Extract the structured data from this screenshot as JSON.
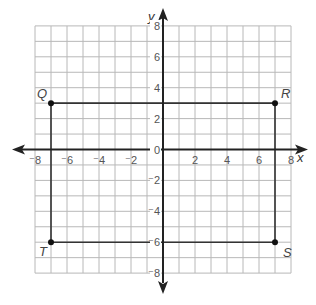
{
  "chart_data": {
    "type": "scatter",
    "title": "",
    "xlabel": "x",
    "ylabel": "y",
    "xlim": [
      -8,
      8
    ],
    "ylim": [
      -8,
      8
    ],
    "grid": true,
    "grid_step": 1,
    "x_ticks": [
      -8,
      -6,
      -4,
      -2,
      0,
      2,
      4,
      6,
      8
    ],
    "y_ticks": [
      -8,
      -6,
      -4,
      -2,
      0,
      2,
      4,
      6,
      8
    ],
    "x_tick_labels": [
      "⁻8",
      "⁻6",
      "⁻4",
      "⁻2",
      "",
      "2",
      "4",
      "6",
      "8"
    ],
    "y_tick_labels": [
      "⁻8",
      "⁻6",
      "⁻4",
      "⁻2",
      "0",
      "2",
      "4",
      "6",
      "8"
    ],
    "points": [
      {
        "label": "Q",
        "x": -7,
        "y": 3
      },
      {
        "label": "R",
        "x": 7,
        "y": 3
      },
      {
        "label": "S",
        "x": 7,
        "y": -6
      },
      {
        "label": "T",
        "x": -7,
        "y": -6
      }
    ],
    "polygon": [
      "Q",
      "R",
      "S",
      "T"
    ],
    "colors": {
      "grid": "#b8b8b8",
      "axis": "#222222",
      "shape": "#333333",
      "point": "#111111"
    }
  }
}
